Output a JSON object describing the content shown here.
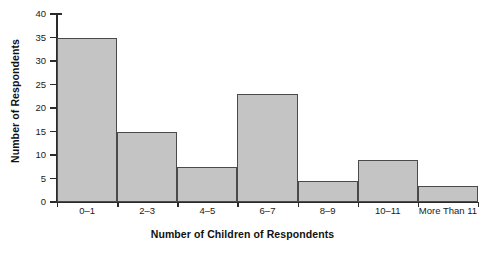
{
  "chart_data": {
    "type": "bar",
    "title": "",
    "subtitle": "",
    "xlabel": "Number of Children of Respondents",
    "ylabel": "Number of Respondents",
    "categories": [
      "0–1",
      "2–3",
      "4–5",
      "6–7",
      "8–9",
      "10–11",
      "More Than 11"
    ],
    "values": [
      35,
      15,
      7.5,
      23,
      4.5,
      9,
      3.5
    ],
    "ylim": [
      0,
      40
    ],
    "yticks": [
      0,
      5,
      10,
      15,
      20,
      25,
      30,
      35,
      40
    ],
    "ytick_labels": [
      "0",
      "5",
      "10",
      "15",
      "20",
      "25",
      "30",
      "35",
      "40"
    ],
    "grid": false,
    "legend": null,
    "legend_position": "none",
    "bar_fill_color": "#c4c4c4",
    "bar_edge_color": "#4a4a4a",
    "axis_color": "#2b2b2b",
    "background_color": "#ffffff"
  }
}
